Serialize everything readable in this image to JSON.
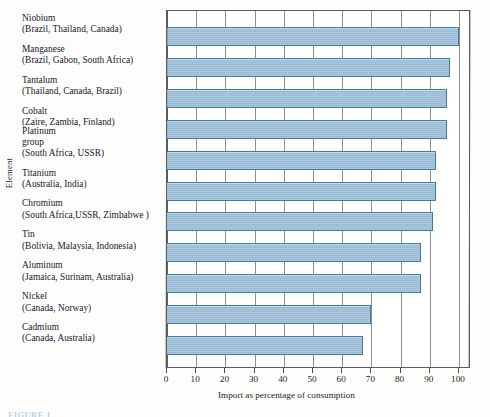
{
  "figure": {
    "caption_partial": "FIGURE 1",
    "y_axis_title": "Element",
    "x_axis_title": "Import as percentage of consumption"
  },
  "chart_data": {
    "type": "bar",
    "orientation": "horizontal",
    "title": "",
    "xlabel": "Import as percentage of consumption",
    "ylabel": "Element",
    "xlim": [
      0,
      100
    ],
    "xticks": [
      "0",
      "10",
      "20",
      "30",
      "40",
      "50",
      "60",
      "70",
      "80",
      "90",
      "100"
    ],
    "grid": true,
    "legend": "none",
    "bar_fill_color": "#9fc0d8",
    "bar_edge_color": "#3c7ea6",
    "categories": [
      "Niobium",
      "Manganese",
      "Tantalum",
      "Cobalt",
      "Platinum group",
      "Titanium",
      "Chromium",
      "Tin",
      "Aluminum",
      "Nickel",
      "Cadmium"
    ],
    "values": [
      100,
      97,
      96,
      96,
      92,
      92,
      91,
      87,
      87,
      70,
      67
    ],
    "items": [
      {
        "name": "Niobium",
        "name_line1": "Niobium",
        "name_line2": "",
        "sources": "(Brazil, Thailand, Canada)",
        "value": 100
      },
      {
        "name": "Manganese",
        "name_line1": "Manganese",
        "name_line2": "",
        "sources": "(Brazil, Gabon, South Africa)",
        "value": 97
      },
      {
        "name": "Tantalum",
        "name_line1": "Tantalum",
        "name_line2": "",
        "sources": "(Thailand, Canada, Brazil)",
        "value": 96
      },
      {
        "name": "Cobalt",
        "name_line1": "Cobalt",
        "name_line2": "",
        "sources": "(Zaire, Zambia, Finland)",
        "value": 96
      },
      {
        "name": "Platinum group",
        "name_line1": "Platinum",
        "name_line2": "group",
        "sources": "(South Africa, USSR)",
        "value": 92
      },
      {
        "name": "Titanium",
        "name_line1": "Titanium",
        "name_line2": "",
        "sources": "(Australia, India)",
        "value": 92
      },
      {
        "name": "Chromium",
        "name_line1": "Chromium",
        "name_line2": "",
        "sources": "(South Africa,USSR, Zimbabwe )",
        "value": 91
      },
      {
        "name": "Tin",
        "name_line1": "Tin",
        "name_line2": "",
        "sources": "(Bolivia, Malaysia, Indonesia)",
        "value": 87
      },
      {
        "name": "Aluminum",
        "name_line1": "Aluminum",
        "name_line2": "",
        "sources": "(Jamaica, Surinam, Australia)",
        "value": 87
      },
      {
        "name": "Nickel",
        "name_line1": "Nickel",
        "name_line2": "",
        "sources": "(Canada, Norway)",
        "value": 70
      },
      {
        "name": "Cadmium",
        "name_line1": "Cadmium",
        "name_line2": "",
        "sources": "(Canada, Australia)",
        "value": 67
      }
    ]
  }
}
